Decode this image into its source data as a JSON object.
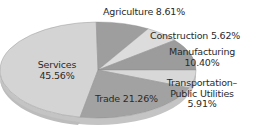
{
  "chart_data": {
    "type": "pie",
    "title": "",
    "style": "3d-tilted",
    "categories": [
      "Services",
      "Agriculture",
      "Construction",
      "Manufacturing",
      "Transportation–Public Utilities",
      "Trade"
    ],
    "values": [
      45.56,
      8.61,
      5.62,
      10.4,
      5.91,
      21.26
    ],
    "unit": "%",
    "colors": [
      "#d4d4d4",
      "#9e9e9e",
      "#dcdcdc",
      "#9c9c9c",
      "#d8d8d8",
      "#a2a2a2"
    ],
    "labels": {
      "services": {
        "name": "Services",
        "value": "45.56%"
      },
      "agriculture": {
        "text": "Agriculture 8.61%"
      },
      "construction": {
        "text": "Construction 5.62%"
      },
      "manufacturing": {
        "name": "Manufacturing",
        "value": "10.40%"
      },
      "transportation": {
        "line1": "Transportation–",
        "line2": "Public Utilities",
        "value": "5.91%"
      },
      "trade": {
        "text": "Trade 21.26%"
      }
    }
  }
}
